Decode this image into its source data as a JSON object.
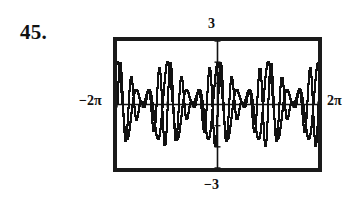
{
  "exercise": {
    "number_label": "45."
  },
  "graph": {
    "name": "graphing-calculator-screen",
    "window": {
      "xmin_label": "−2π",
      "xmax_label": "2π",
      "ymax_label": "3",
      "ymin_label": "−3"
    },
    "colors": {
      "frame": "#1a1a1a",
      "curve": "#111111",
      "axis": "#111111",
      "background": "#ffffff"
    }
  },
  "chart_data": {
    "type": "line",
    "title": "",
    "subtitle": "",
    "xlabel": "",
    "ylabel": "",
    "xlim": [
      -6.283185307179586,
      6.283185307179586
    ],
    "ylim": [
      -3,
      3
    ],
    "xtick_labels": [
      "−2π",
      "2π"
    ],
    "ytick_labels": [
      "3",
      "−3"
    ],
    "grid": false,
    "legend": "none",
    "axes_shown": [
      "x-axis",
      "y-axis"
    ],
    "tick_spacing_x": 1.5707963267948966,
    "tick_spacing_y": 1,
    "render_style": "pixelated-stairstep",
    "annotations": [
      "window values printed outside the screen frame",
      "two superimposed oscillating curves",
      "pattern symmetric about the y-axis"
    ],
    "series": [
      {
        "name": "slow-beat-wave",
        "expression": "2*cos(x)*cos(5*x)",
        "samples_x": [
          -6.283185307179586,
          -6.0,
          -5.7,
          -5.4,
          -5.1,
          -4.8,
          -4.5,
          -4.2,
          -3.9,
          -3.6,
          -3.3,
          -3.0,
          -2.7,
          -2.4,
          -2.1,
          -1.8,
          -1.5,
          -1.2,
          -0.9,
          -0.6,
          -0.3,
          0.0,
          0.3,
          0.6,
          0.9,
          1.2,
          1.5,
          1.8,
          2.1,
          2.4,
          2.7,
          3.0,
          3.3,
          3.6,
          3.9,
          4.2,
          4.5,
          4.8,
          5.1,
          5.4,
          5.7,
          6.0,
          6.283185307179586
        ],
        "samples_y": [
          2.0,
          1.34,
          -0.14,
          -1.39,
          -1.58,
          -0.62,
          0.62,
          1.16,
          0.71,
          -0.17,
          -0.73,
          -0.56,
          0.09,
          0.6,
          0.43,
          -0.38,
          -1.08,
          -1.0,
          0.13,
          1.37,
          1.58,
          2.0,
          1.58,
          1.37,
          0.13,
          -1.0,
          -1.08,
          -0.38,
          0.43,
          0.6,
          0.09,
          -0.56,
          -0.73,
          -0.17,
          0.71,
          1.16,
          0.62,
          -0.62,
          -1.58,
          -1.39,
          -0.14,
          1.34,
          2.0
        ]
      },
      {
        "name": "fast-ripple-wave",
        "expression": "2*cos(x)*sin(9*x)",
        "samples_x": [
          -6.283185307179586,
          -6.0,
          -5.7,
          -5.4,
          -5.1,
          -4.8,
          -4.5,
          -4.2,
          -3.9,
          -3.6,
          -3.3,
          -3.0,
          -2.7,
          -2.4,
          -2.1,
          -1.8,
          -1.5,
          -1.2,
          -0.9,
          -0.6,
          -0.3,
          0.0,
          0.3,
          0.6,
          0.9,
          1.2,
          1.5,
          1.8,
          2.1,
          2.4,
          2.7,
          3.0,
          3.3,
          3.6,
          3.9,
          4.2,
          4.5,
          4.8,
          5.1,
          5.4,
          5.7,
          6.0,
          6.283185307179586
        ],
        "samples_y": [
          0.0,
          -1.43,
          -0.54,
          1.14,
          0.45,
          -0.9,
          0.18,
          0.55,
          -0.81,
          -0.17,
          0.77,
          -0.41,
          -0.16,
          0.54,
          -0.69,
          0.16,
          0.18,
          -0.86,
          1.05,
          -0.01,
          -1.4,
          0.0,
          1.4,
          0.01,
          -1.05,
          0.86,
          -0.18,
          -0.16,
          0.69,
          -0.54,
          0.16,
          0.41,
          -0.77,
          0.17,
          0.81,
          -0.55,
          -0.18,
          0.9,
          -0.45,
          -1.14,
          0.54,
          1.43,
          0.0
        ]
      }
    ]
  }
}
